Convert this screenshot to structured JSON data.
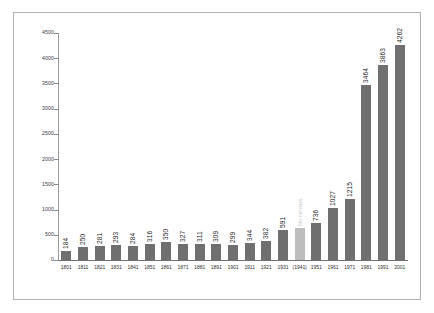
{
  "chart_data": {
    "type": "bar",
    "title": "",
    "subtitle": "",
    "xlabel": "",
    "ylabel": "",
    "ylim": [
      0,
      4500
    ],
    "y_ticks": [
      0,
      500,
      1000,
      1500,
      2000,
      2500,
      3000,
      3500,
      4000,
      4500
    ],
    "grid": false,
    "legend": "none",
    "bar_color": "#6f6f6f",
    "nocensus_bar_color": "#bdbdbd",
    "nocensus_label_color": "#c2c2c2",
    "categories": [
      "1801",
      "1811",
      "1821",
      "1831",
      "1841",
      "1851",
      "1861",
      "1871",
      "1881",
      "1891",
      "1901",
      "1911",
      "1921",
      "1931",
      "(1941)",
      "1951",
      "1961",
      "1971",
      "1981",
      "1991",
      "2001"
    ],
    "values": [
      184,
      250,
      281,
      293,
      284,
      316,
      350,
      327,
      311,
      309,
      299,
      344,
      382,
      591,
      640,
      736,
      1027,
      1215,
      3464,
      3863,
      4262
    ],
    "labels": [
      "184",
      "250",
      "281",
      "293",
      "284",
      "316",
      "350",
      "327",
      "311",
      "309",
      "299",
      "344",
      "382",
      "591",
      "No census",
      "736",
      "1027",
      "1215",
      "3464",
      "3863",
      "4262"
    ],
    "annotations": [
      {
        "category": "(1941)",
        "text": "No census",
        "note": "bar shown in lighter grey, value not recorded"
      }
    ]
  }
}
